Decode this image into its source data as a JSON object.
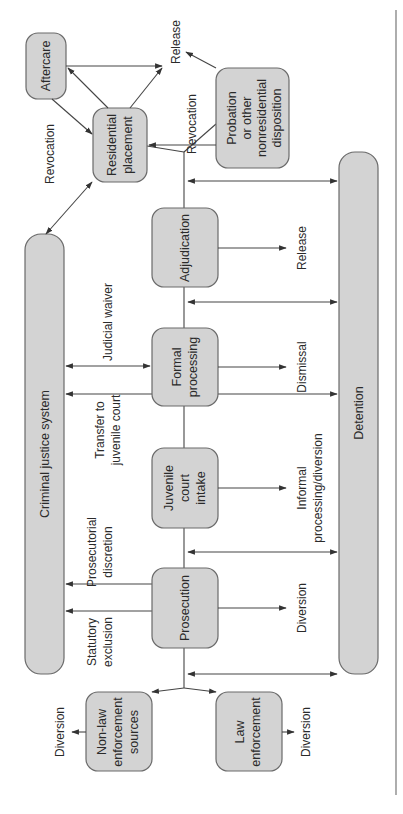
{
  "diagram": {
    "type": "flowchart",
    "orientation": "rotated-90-ccw",
    "nodes": {
      "non_law": {
        "label_lines": [
          "Non-law",
          "enforcement",
          "sources"
        ]
      },
      "law": {
        "label_lines": [
          "Law",
          "enforcement"
        ]
      },
      "prosecution": {
        "label_lines": [
          "Prosecution"
        ]
      },
      "juvenile_intake": {
        "label_lines": [
          "Juvenile",
          "court",
          "intake"
        ]
      },
      "formal": {
        "label_lines": [
          "Formal",
          "processing"
        ]
      },
      "adjudication": {
        "label_lines": [
          "Adjudication"
        ]
      },
      "residential": {
        "label_lines": [
          "Residential",
          "placement"
        ]
      },
      "probation": {
        "label_lines": [
          "Probation",
          "or other",
          "nonresidential",
          "disposition"
        ]
      },
      "aftercare": {
        "label_lines": [
          "Aftercare"
        ]
      },
      "criminal_justice": {
        "label": "Criminal justice system"
      },
      "detention": {
        "label": "Detention"
      }
    },
    "edge_labels": {
      "diversion_nonlaw": "Diversion",
      "diversion_law": "Diversion",
      "statutory_exclusion": [
        "Statutory",
        "exclusion"
      ],
      "prosecutorial_discretion": [
        "Prosecutorial",
        "discretion"
      ],
      "diversion_prosecution": "Diversion",
      "transfer_to_juvenile": [
        "Transfer to",
        "juvenile court"
      ],
      "informal_processing": [
        "Informal",
        "processing/diversion"
      ],
      "judicial_waiver": "Judicial waiver",
      "dismissal": "Dismissal",
      "release_adjudication": "Release",
      "revocation_probation": "Revocation",
      "revocation_aftercare": "Revocation",
      "release_top": "Release"
    }
  }
}
